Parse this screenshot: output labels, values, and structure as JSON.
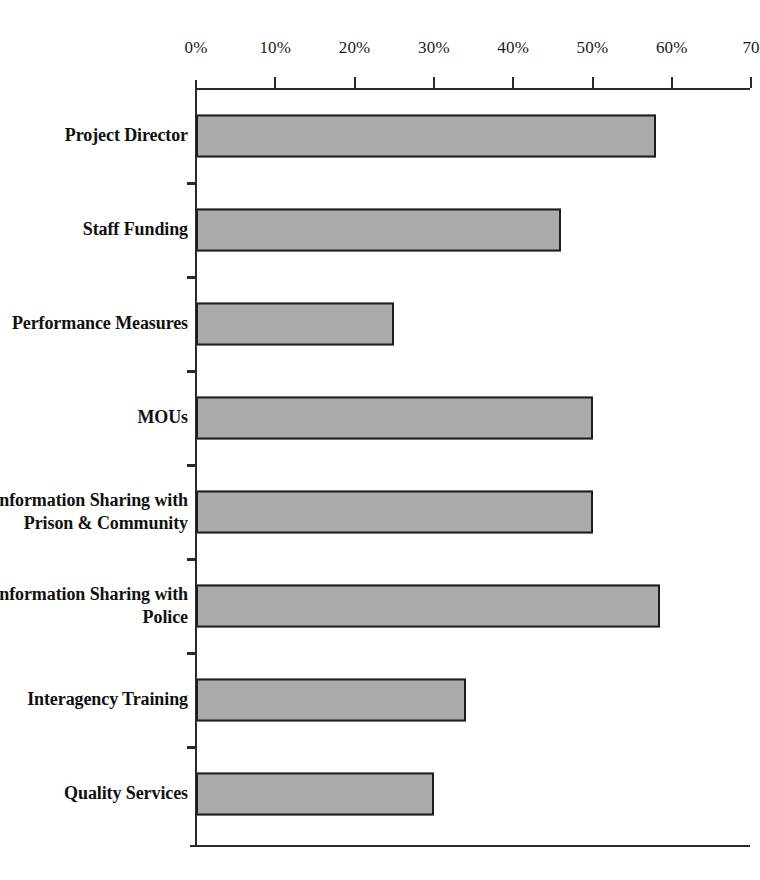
{
  "chart_data": {
    "type": "bar",
    "orientation": "horizontal",
    "title": "",
    "subtitle": "",
    "xlabel": "",
    "ylabel": "",
    "xlim": [
      0,
      70
    ],
    "xtick_labels": [
      "0%",
      "10%",
      "20%",
      "30%",
      "40%",
      "50%",
      "60%",
      "70"
    ],
    "xtick_values": [
      0,
      10,
      20,
      30,
      40,
      50,
      60,
      70
    ],
    "grid": false,
    "legend": null,
    "bar_fill_color": "#ababab",
    "bar_border_color": "#1d1d1d",
    "axis_color": "#2a2a2a",
    "background_color": "#ffffff",
    "categories": [
      "Project Director",
      "Staff Funding",
      "Performance Measures",
      "MOUs",
      "Information Sharing with Prison & Community",
      "Information Sharing with Police",
      "Interagency Training",
      "Quality Services"
    ],
    "category_lines": [
      [
        "Project Director"
      ],
      [
        "Staff Funding"
      ],
      [
        "Performance Measures"
      ],
      [
        "MOUs"
      ],
      [
        "Information Sharing with",
        "Prison & Community"
      ],
      [
        "Information Sharing with",
        "Police"
      ],
      [
        "Interagency Training"
      ],
      [
        "Quality Services"
      ]
    ],
    "values": [
      58,
      46,
      25,
      50,
      50,
      58.5,
      34,
      30
    ],
    "value_unit": "%"
  }
}
